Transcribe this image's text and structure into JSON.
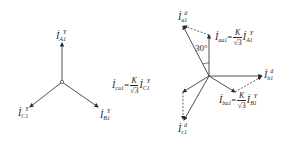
{
  "figure": {
    "left_diagram": {
      "title": "Y-side phasors",
      "center": [
        62,
        82
      ],
      "phasors": [
        {
          "id": "IA1Y",
          "base": "İ",
          "sub": "A1",
          "sup": "Y",
          "tip": [
            62,
            43
          ]
        },
        {
          "id": "IB1Y",
          "base": "İ",
          "sub": "B1",
          "sup": "Y",
          "tip": [
            98,
            107
          ]
        },
        {
          "id": "IC1Y",
          "base": "İ",
          "sub": "C1",
          "sup": "Y",
          "tip": [
            30,
            107
          ]
        }
      ]
    },
    "right_diagram": {
      "title": "Delta-side phasors",
      "center": [
        209,
        76
      ],
      "angle_label": "30°",
      "phasors": [
        {
          "id": "Ia1d",
          "base": "İ",
          "sub": "a1",
          "sup": "d",
          "tip": [
            183,
            26
          ]
        },
        {
          "id": "Ib1d",
          "base": "İ",
          "sub": "b1",
          "sup": "d",
          "tip": [
            262,
            76
          ]
        },
        {
          "id": "Ic1d",
          "base": "İ",
          "sub": "c1",
          "sup": "d",
          "tip": [
            183,
            120
          ]
        },
        {
          "id": "Iaa1",
          "base": "İ",
          "sub": "aa1",
          "tip": [
            209,
            35
          ]
        },
        {
          "id": "Iba1",
          "base": "İ",
          "sub": "ba1",
          "tip": [
            235,
            92
          ]
        },
        {
          "id": "Ica1",
          "base": "İ",
          "sub": "ca1",
          "tip": [
            183,
            92
          ]
        }
      ],
      "equations": {
        "aa1": {
          "lhs_base": "İ",
          "lhs_sub": "aa1",
          "num": "K",
          "den": "√3",
          "rhs_base": "İ",
          "rhs_sub": "A1",
          "rhs_sup": "Y"
        },
        "ba1": {
          "lhs_base": "İ",
          "lhs_sub": "ba1",
          "num": "K",
          "den": "√3",
          "rhs_base": "İ",
          "rhs_sub": "B1",
          "rhs_sup": "Y"
        },
        "ca1": {
          "lhs_base": "İ",
          "lhs_sub": "ca1",
          "num": "K",
          "den": "√3",
          "rhs_base": "İ",
          "rhs_sub": "C1",
          "rhs_sup": "Y"
        }
      },
      "equals_sign": "="
    }
  },
  "colors": {
    "line": "#3a3a3a",
    "text": "#2a2a2a",
    "background": "#ffffff"
  }
}
